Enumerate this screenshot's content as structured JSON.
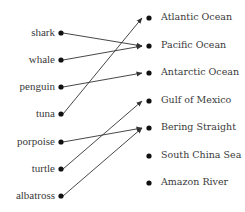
{
  "left_items": [
    {
      "label": "shark",
      "y": 33
    },
    {
      "label": "whale",
      "y": 60
    },
    {
      "label": "penguin",
      "y": 87
    },
    {
      "label": "tuna",
      "y": 114
    },
    {
      "label": "porpoise",
      "y": 142
    },
    {
      "label": "turtle",
      "y": 169
    },
    {
      "label": "albatross",
      "y": 196
    }
  ],
  "right_items": [
    {
      "label": "Atlantic Ocean",
      "y": 18
    },
    {
      "label": "Pacific Ocean",
      "y": 46
    },
    {
      "label": "Antarctic Ocean",
      "y": 73
    },
    {
      "label": "Gulf of Mexico",
      "y": 101
    },
    {
      "label": "Bering Straight",
      "y": 128
    },
    {
      "label": "South China Sea",
      "y": 156
    },
    {
      "label": "Amazon River",
      "y": 183
    }
  ],
  "connections": [
    {
      "from": "shark",
      "to": "Pacific Ocean"
    },
    {
      "from": "whale",
      "to": "Pacific Ocean"
    },
    {
      "from": "penguin",
      "to": "Antarctic Ocean"
    },
    {
      "from": "tuna",
      "to": "Atlantic Ocean"
    },
    {
      "from": "porpoise",
      "to": "Bering Straight"
    },
    {
      "from": "turtle",
      "to": "Gulf of Mexico"
    },
    {
      "from": "albatross",
      "to": "Bering Straight"
    }
  ],
  "colors": {
    "line": "#333333",
    "dot": "#111111",
    "text": "#3a3a3a"
  }
}
